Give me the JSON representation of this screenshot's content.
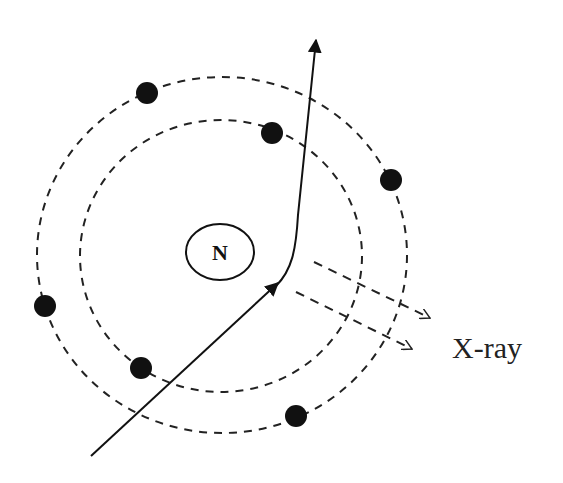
{
  "diagram": {
    "type": "atomic-bremsstrahlung-xray",
    "nucleus": {
      "label": "N",
      "cx": 220,
      "cy": 252,
      "rx": 34,
      "ry": 28
    },
    "orbits": [
      {
        "name": "inner-shell",
        "cx": 221,
        "cy": 256,
        "rx": 141,
        "ry": 136
      },
      {
        "name": "outer-shell",
        "cx": 222,
        "cy": 255,
        "rx": 185,
        "ry": 178
      }
    ],
    "electrons": [
      {
        "cx": 147,
        "cy": 93
      },
      {
        "cx": 272,
        "cy": 133
      },
      {
        "cx": 391,
        "cy": 180
      },
      {
        "cx": 45,
        "cy": 306
      },
      {
        "cx": 141,
        "cy": 368
      },
      {
        "cx": 296,
        "cy": 416
      }
    ],
    "incoming_particle": {
      "from": [
        91,
        456
      ],
      "to": [
        278,
        283
      ]
    },
    "deflected_particle": {
      "path": "M 276 286 C 292 270, 296 250, 298 215 L 316 40"
    },
    "xray_label": "X-ray",
    "xray_arrows": [
      {
        "from": [
          314,
          262
        ],
        "to": [
          430,
          318
        ]
      },
      {
        "from": [
          296,
          292
        ],
        "to": [
          412,
          349
        ]
      }
    ],
    "colors": {
      "stroke": "#111111",
      "dash": "#222222",
      "electron": "#111111",
      "background": "#ffffff"
    }
  }
}
